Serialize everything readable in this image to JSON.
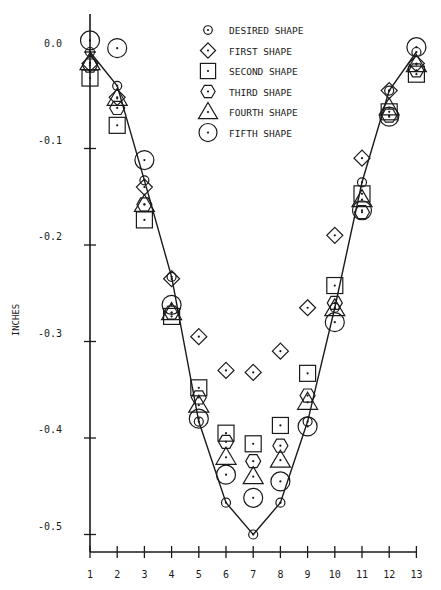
{
  "chart_data": {
    "type": "line",
    "title": "",
    "xlabel": "",
    "ylabel": "INCHES",
    "x": [
      1,
      2,
      3,
      4,
      5,
      6,
      7,
      8,
      9,
      10,
      11,
      12,
      13
    ],
    "x_ticks": [
      "1",
      "2",
      "3",
      "4",
      "5",
      "6",
      "7",
      "8",
      "9",
      "10",
      "11",
      "12",
      "13"
    ],
    "y_ticks": [
      "0.0",
      "-0.1",
      "-0.2",
      "-0.3",
      "-0.4",
      "-0.5"
    ],
    "y_tick_values": [
      0.0,
      -0.1,
      -0.2,
      -0.3,
      -0.4,
      -0.5
    ],
    "ylim": [
      -0.53,
      0.02
    ],
    "xlim": [
      1,
      13
    ],
    "grid": false,
    "legend_position": "top-center",
    "series": [
      {
        "name": "DESIRED SHAPE",
        "marker": "small-circle-dot",
        "line": true,
        "values": [
          0.0,
          -0.035,
          -0.133,
          -0.233,
          -0.383,
          -0.467,
          -0.5,
          -0.467,
          -0.383,
          -0.265,
          -0.135,
          -0.04,
          0.0
        ]
      },
      {
        "name": "FIRST SHAPE",
        "marker": "diamond",
        "values": [
          -0.012,
          -0.047,
          -0.14,
          -0.235,
          -0.295,
          -0.33,
          -0.332,
          -0.31,
          -0.265,
          -0.19,
          -0.11,
          -0.04,
          -0.012
        ]
      },
      {
        "name": "SECOND SHAPE",
        "marker": "square",
        "values": [
          -0.027,
          -0.076,
          -0.174,
          -0.274,
          -0.348,
          -0.395,
          -0.406,
          -0.387,
          -0.333,
          -0.242,
          -0.147,
          -0.062,
          -0.023
        ]
      },
      {
        "name": "THIRD SHAPE",
        "marker": "hexagon",
        "values": [
          -0.014,
          -0.058,
          -0.158,
          -0.27,
          -0.358,
          -0.404,
          -0.424,
          -0.408,
          -0.356,
          -0.26,
          -0.166,
          -0.066,
          -0.019
        ]
      },
      {
        "name": "FOURTH SHAPE",
        "marker": "triangle",
        "values": [
          -0.011,
          -0.048,
          -0.158,
          -0.27,
          -0.366,
          -0.42,
          -0.44,
          -0.423,
          -0.363,
          -0.266,
          -0.153,
          -0.058,
          -0.013
        ]
      },
      {
        "name": "FIFTH SHAPE",
        "marker": "large-circle-dot",
        "values": [
          0.012,
          0.004,
          -0.112,
          -0.262,
          -0.38,
          -0.438,
          -0.462,
          -0.445,
          -0.388,
          -0.28,
          -0.164,
          -0.067,
          0.005
        ]
      }
    ]
  },
  "legend": {
    "items": [
      {
        "label": "DESIRED SHAPE"
      },
      {
        "label": "FIRST SHAPE"
      },
      {
        "label": "SECOND SHAPE"
      },
      {
        "label": "THIRD SHAPE"
      },
      {
        "label": "FOURTH SHAPE"
      },
      {
        "label": "FIFTH SHAPE"
      }
    ]
  },
  "colors": {
    "ink": "#1a1a1a",
    "background": "#ffffff"
  }
}
